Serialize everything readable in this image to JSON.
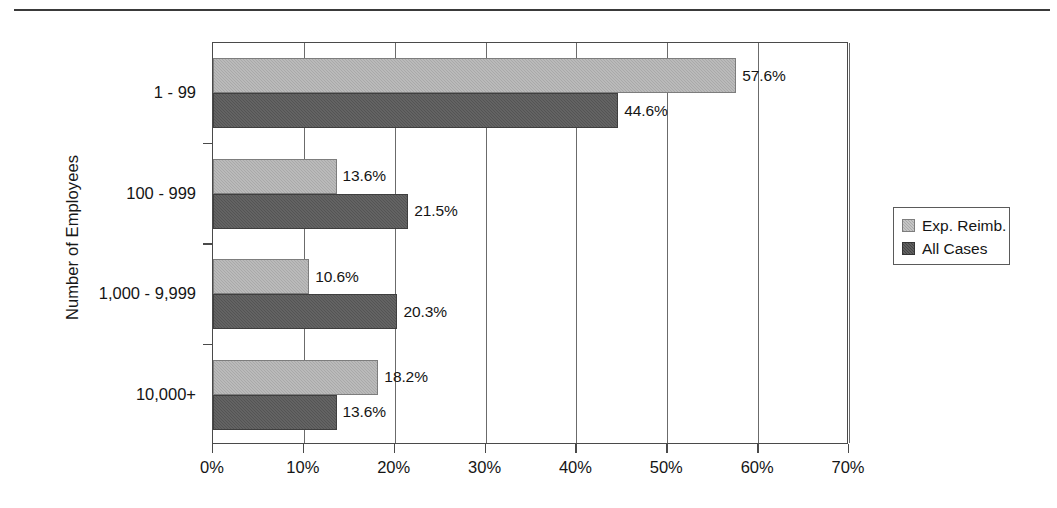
{
  "chart_data": {
    "type": "bar",
    "orientation": "horizontal",
    "title": "",
    "xlabel": "",
    "ylabel": "Number of Employees",
    "categories": [
      "1 - 99",
      "100 - 999",
      "1,000 - 9,999",
      "10,000+"
    ],
    "series": [
      {
        "name": "Exp. Reimb.",
        "color": "#a9a9a9",
        "values": [
          57.6,
          13.6,
          10.6,
          18.2
        ],
        "labels": [
          "57.6%",
          "13.6%",
          "10.6%",
          "18.2%"
        ]
      },
      {
        "name": "All Cases",
        "color": "#545454",
        "values": [
          44.6,
          21.5,
          20.3,
          13.6
        ],
        "labels": [
          "44.6%",
          "21.5%",
          "20.3%",
          "13.6%"
        ]
      }
    ],
    "xlim": [
      0,
      70
    ],
    "xticks": [
      0,
      10,
      20,
      30,
      40,
      50,
      60,
      70
    ],
    "xticklabels": [
      "0%",
      "10%",
      "20%",
      "30%",
      "40%",
      "50%",
      "60%",
      "70%"
    ],
    "grid": "vertical",
    "legend_position": "right"
  },
  "legend": {
    "entries": [
      {
        "label": "Exp. Reimb."
      },
      {
        "label": "All Cases"
      }
    ]
  },
  "axes": {
    "y_title": "Number of Employees"
  }
}
